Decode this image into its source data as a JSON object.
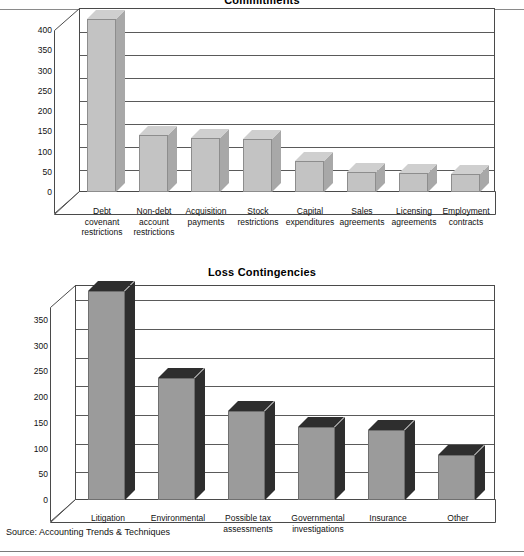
{
  "source_note": "Source: Accounting Trends & Techniques",
  "chart_data": [
    {
      "type": "bar",
      "title": "Commitments",
      "xlabel": "",
      "ylabel": "",
      "ylim": [
        0,
        400
      ],
      "yticks": [
        0,
        50,
        100,
        150,
        200,
        250,
        300,
        350,
        400
      ],
      "grid": true,
      "legend": "none",
      "style": "3d-column",
      "categories": [
        "Debt covenant restrictions",
        "Non-debt account restrictions",
        "Acquisition payments",
        "Stock restrictions",
        "Capital expenditures",
        "Sales agreements",
        "Licensing agreements",
        "Employment contracts"
      ],
      "category_lines": [
        [
          "Debt",
          "covenant",
          "restrictions"
        ],
        [
          "Non-debt",
          "account",
          "restrictions"
        ],
        [
          "Acquisition",
          "payments"
        ],
        [
          "Stock",
          "restrictions"
        ],
        [
          "Capital",
          "expenditures"
        ],
        [
          "Sales",
          "agreements"
        ],
        [
          "Licensing",
          "agreements"
        ],
        [
          "Employment",
          "contracts"
        ]
      ],
      "values": [
        377,
        123,
        118,
        116,
        67,
        44,
        42,
        40
      ]
    },
    {
      "type": "bar",
      "title": "Loss Contingencies",
      "xlabel": "",
      "ylabel": "",
      "ylim": [
        0,
        375
      ],
      "yticks": [
        0,
        50,
        100,
        150,
        200,
        250,
        300,
        350
      ],
      "grid": true,
      "legend": "none",
      "style": "3d-column",
      "categories": [
        "Litigation",
        "Environmental",
        "Possible tax assessments",
        "Governmental investigations",
        "Insurance",
        "Other"
      ],
      "category_lines": [
        [
          "Litigation"
        ],
        [
          "Environmental"
        ],
        [
          "Possible tax",
          "assessments"
        ],
        [
          "Governmental",
          "investigations"
        ],
        [
          "Insurance"
        ],
        [
          "Other"
        ]
      ],
      "values": [
        365,
        212,
        155,
        127,
        122,
        78
      ]
    }
  ]
}
